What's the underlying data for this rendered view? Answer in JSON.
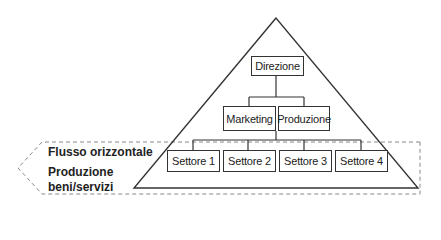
{
  "diagram": {
    "top": {
      "label": "Direzione"
    },
    "middle": [
      {
        "label": "Marketing"
      },
      {
        "label": "Produzione"
      }
    ],
    "bottom": [
      {
        "label": "Settore 1"
      },
      {
        "label": "Settore 2"
      },
      {
        "label": "Settore 3"
      },
      {
        "label": "Settore 4"
      }
    ],
    "arrow_labels": {
      "flow": "Flusso orizzontale",
      "production": "Produzione beni/servizi"
    }
  }
}
